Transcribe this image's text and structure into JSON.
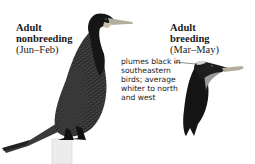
{
  "nonbreeding": {
    "title_line1": "Adult",
    "title_line2": "nonbreeding",
    "season": "(Jun–Feb)"
  },
  "breeding": {
    "title_line1": "Adult",
    "title_line2": "breeding",
    "season": "(Mar–May)"
  },
  "annotation": {
    "lines": [
      "plumes black in",
      "southeastern",
      "birds; average",
      "whiter to north",
      "and west"
    ]
  },
  "illustrations": {
    "left": "cormorant-nonbreeding-perched-icon",
    "right": "cormorant-breeding-head-icon"
  },
  "colors": {
    "plumage": "#1c1c1c",
    "scale_gray": "#5a5a5a",
    "bill": "#b8b0a0",
    "throat_patch": "#c8c8c8",
    "post": "#e4e4e4"
  }
}
